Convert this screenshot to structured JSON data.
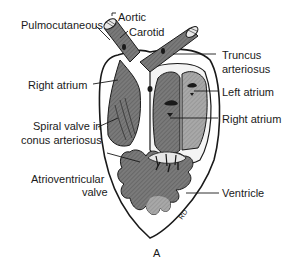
{
  "figure": {
    "panel_label": "A",
    "signature": "RD",
    "labels": {
      "pulmocutaneous": "Pulmocutaneous",
      "aortic": "Aortic",
      "carotid": "Carotid",
      "truncus_line1": "Truncus",
      "truncus_line2": "arteriosus",
      "right_atrium_left": "Right atrium",
      "left_atrium": "Left atrium",
      "spiral_line1": "Spiral valve in",
      "spiral_line2": "conus arteriosus",
      "right_atrium_right": "Right atrium",
      "av_line1": "Atrioventricular",
      "av_line2": "valve",
      "ventricle": "Ventricle"
    },
    "colors": {
      "outline": "#1a1a1a",
      "dark_fill": "#6e6e6e",
      "mid_fill": "#8c8c8c",
      "light_fill": "#b4b4b4",
      "background": "#ffffff"
    }
  }
}
